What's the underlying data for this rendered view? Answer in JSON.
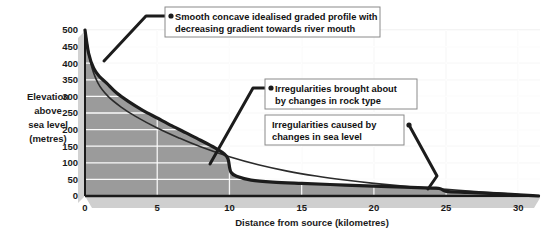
{
  "chart_data": {
    "type": "area",
    "title": "",
    "subtitle": "",
    "xlabel": "Distance from source (kilometres)",
    "ylabel": "Elevation above sea level (metres)",
    "ylabel_lines": [
      "Elevation",
      "above",
      "sea level",
      "(metres)"
    ],
    "xlim": [
      0,
      31.5
    ],
    "ylim": [
      0,
      500
    ],
    "grid": true,
    "grid_orientation": "horizontal-and-vertical",
    "legend": "none",
    "x_ticks": [
      0,
      5,
      10,
      15,
      20,
      25,
      30
    ],
    "x_tick_labels": [
      "0",
      "5",
      "10",
      "15",
      "20",
      "25",
      "30"
    ],
    "y_ticks": [
      0,
      50,
      100,
      150,
      200,
      250,
      300,
      350,
      400,
      450,
      500
    ],
    "y_tick_labels": [
      "0",
      "50",
      "100",
      "150",
      "200",
      "250",
      "300",
      "350",
      "400",
      "450",
      "500"
    ],
    "series": [
      {
        "name": "Actual long profile",
        "style": "thick-dark-line-with-fill",
        "color": "#1c1c1c",
        "fill_color": "#9b9b9b",
        "points": [
          [
            0.0,
            500
          ],
          [
            0.25,
            430
          ],
          [
            0.6,
            385
          ],
          [
            1.0,
            360
          ],
          [
            1.5,
            340
          ],
          [
            2.2,
            310
          ],
          [
            3.0,
            285
          ],
          [
            4.0,
            258
          ],
          [
            5.0,
            235
          ],
          [
            6.0,
            212
          ],
          [
            7.0,
            190
          ],
          [
            8.0,
            168
          ],
          [
            9.0,
            145
          ],
          [
            9.6,
            128
          ],
          [
            9.9,
            112
          ],
          [
            10.1,
            72
          ],
          [
            10.6,
            58
          ],
          [
            11.5,
            48
          ],
          [
            13.0,
            42
          ],
          [
            15.0,
            38
          ],
          [
            18.0,
            33
          ],
          [
            21.0,
            28
          ],
          [
            24.0,
            24
          ],
          [
            24.6,
            22
          ],
          [
            25.0,
            14
          ],
          [
            26.5,
            11
          ],
          [
            28.0,
            8
          ],
          [
            29.5,
            5
          ],
          [
            31.0,
            1
          ],
          [
            31.4,
            0
          ]
        ]
      },
      {
        "name": "Smooth concave idealised graded profile",
        "style": "thin-dark-line",
        "color": "#2b2b2b",
        "points": [
          [
            0.0,
            500
          ],
          [
            0.4,
            400
          ],
          [
            0.9,
            340
          ],
          [
            1.6,
            300
          ],
          [
            2.5,
            268
          ],
          [
            3.5,
            240
          ],
          [
            5.0,
            205
          ],
          [
            6.5,
            175
          ],
          [
            8.0,
            148
          ],
          [
            10.0,
            118
          ],
          [
            12.0,
            94
          ],
          [
            14.0,
            75
          ],
          [
            16.0,
            60
          ],
          [
            18.0,
            48
          ],
          [
            20.0,
            38
          ],
          [
            22.5,
            28
          ],
          [
            25.0,
            20
          ],
          [
            27.5,
            12
          ],
          [
            29.5,
            6
          ],
          [
            31.4,
            0
          ]
        ]
      }
    ],
    "annotations": [
      {
        "id": "annotation-graded-profile",
        "text_lines": [
          "Smooth concave idealised graded profile with",
          "decreasing gradient towards river mouth"
        ],
        "box": {
          "x": 165,
          "y": 7,
          "width": 215,
          "height": 30
        },
        "marker": {
          "x": 171,
          "y": 16
        },
        "leader": [
          [
            171,
            16
          ],
          [
            146,
            16
          ],
          [
            104,
            61
          ]
        ],
        "target_km": 0.95,
        "target_elevation": 395
      },
      {
        "id": "annotation-rock-type",
        "text_lines": [
          "Irregularities brought about",
          "by changes in rock type"
        ],
        "box": {
          "x": 265,
          "y": 79,
          "width": 152,
          "height": 30
        },
        "marker": {
          "x": 271,
          "y": 88
        },
        "leader": [
          [
            271,
            88
          ],
          [
            253,
            88
          ],
          [
            210,
            164
          ]
        ],
        "target_km": 10.05,
        "target_elevation": 90
      },
      {
        "id": "annotation-sea-level",
        "text_lines": [
          "Irregularities caused by",
          "changes in sea level"
        ],
        "box": {
          "x": 265,
          "y": 115,
          "width": 139,
          "height": 30
        },
        "marker": {
          "x": 409,
          "y": 125
        },
        "leader": [
          [
            409,
            125
          ],
          [
            437,
            176
          ],
          [
            428,
            189
          ]
        ],
        "target_km": 24.6,
        "target_elevation": 18
      }
    ],
    "colors": {
      "plot_fill": "#9b9b9b",
      "plot_background": "#ffffff",
      "gridline": "#ffffff",
      "faint_gridline": "#e8e8e8",
      "profile_line": "#1c1c1c",
      "axis_line": "#1a1a1a",
      "base_shadow": "#d6d6d6",
      "callout_border": "#8a8a8a",
      "text": "#1a1a1a"
    }
  }
}
